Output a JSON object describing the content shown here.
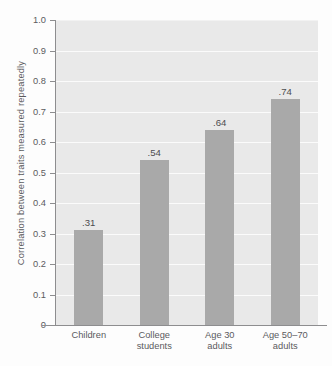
{
  "chart_data": {
    "type": "bar",
    "title": "",
    "subtitle": "",
    "xlabel": "",
    "ylabel": "Correlation between traits measured repeatedly",
    "ylim": [
      0,
      1.0
    ],
    "ytick_labels": [
      "1.0",
      "0.9",
      "0.8",
      "0.7",
      "0.6",
      "0.5",
      "0.4",
      "0.3",
      "0.2",
      "0.1",
      "0"
    ],
    "ytick_values": [
      1.0,
      0.9,
      0.8,
      0.7,
      0.6,
      0.5,
      0.4,
      0.3,
      0.2,
      0.1,
      0
    ],
    "grid": "horizontal",
    "legend": "none",
    "categories": [
      "Children",
      "College students",
      "Age 30 adults",
      "Age 50–70 adults"
    ],
    "category_lines": [
      [
        "Children",
        ""
      ],
      [
        "College",
        "students"
      ],
      [
        "Age 30",
        "adults"
      ],
      [
        "Age 50–70",
        "adults"
      ]
    ],
    "values": [
      0.31,
      0.54,
      0.64,
      0.74
    ],
    "value_labels": [
      ".31",
      ".54",
      ".64",
      ".74"
    ],
    "bar_color": "#a9a9a9",
    "plot_background": "#e9e9e9",
    "gridline_color": "#fbfbfb",
    "axis_color": "#8d8d8f",
    "text_color": "#5b5b5d"
  }
}
